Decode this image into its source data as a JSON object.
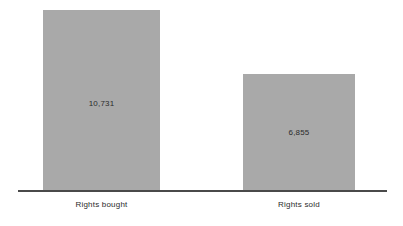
{
  "chart_data": {
    "type": "bar",
    "title": "",
    "subtitle": "",
    "xlabel": "",
    "ylabel": "",
    "categories": [
      "Rights bought",
      "Rights sold"
    ],
    "values": [
      10731,
      6855
    ],
    "value_labels": [
      "10,731",
      "6,855"
    ],
    "ylim": [
      0,
      11900
    ],
    "grid": false,
    "legend": false,
    "axis": {
      "baseline_visible": true,
      "y_axis_visible": false,
      "tick_labels_visible": false
    },
    "colors": {
      "bar_fill": "#a9a9a9",
      "axis_line": "#4a4a4a",
      "text": "#2b2b2b",
      "background": "#ffffff"
    },
    "series": [
      {
        "name": "",
        "points": [
          {
            "category": "Rights bought",
            "value": 10731,
            "label": "10,731"
          },
          {
            "category": "Rights sold",
            "value": 6855,
            "label": "6,855"
          }
        ]
      }
    ]
  }
}
